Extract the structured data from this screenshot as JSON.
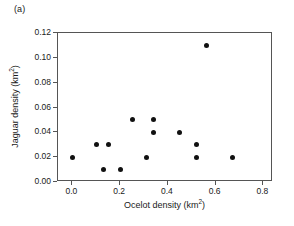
{
  "panel": {
    "label": "(a)"
  },
  "chart_data": {
    "type": "scatter",
    "title": "",
    "subtitle": "",
    "xlabel": "Ocelot density (km²)",
    "ylabel": "Jaguar density (km²)",
    "xlim": [
      -0.06,
      0.84
    ],
    "ylim": [
      0.0,
      0.12
    ],
    "xticks": [
      0.0,
      0.2,
      0.4,
      0.6,
      0.8
    ],
    "xtick_labels": [
      "0.0",
      "0.2",
      "0.4",
      "0.6",
      "0.8"
    ],
    "yticks": [
      0.0,
      0.02,
      0.04,
      0.06,
      0.08,
      0.1,
      0.12
    ],
    "ytick_labels": [
      "0.00",
      "0.02",
      "0.04",
      "0.06",
      "0.08",
      "0.10",
      "0.12"
    ],
    "grid": false,
    "legend": null,
    "marker": {
      "shape": "circle",
      "color": "#111111",
      "size_px": 5
    },
    "series": [
      {
        "name": "sites",
        "points": [
          {
            "x": 0.0,
            "y": 0.02
          },
          {
            "x": 0.1,
            "y": 0.03
          },
          {
            "x": 0.13,
            "y": 0.01
          },
          {
            "x": 0.15,
            "y": 0.03
          },
          {
            "x": 0.2,
            "y": 0.01
          },
          {
            "x": 0.25,
            "y": 0.05
          },
          {
            "x": 0.31,
            "y": 0.02
          },
          {
            "x": 0.34,
            "y": 0.05
          },
          {
            "x": 0.34,
            "y": 0.04
          },
          {
            "x": 0.45,
            "y": 0.04
          },
          {
            "x": 0.52,
            "y": 0.03
          },
          {
            "x": 0.52,
            "y": 0.02
          },
          {
            "x": 0.56,
            "y": 0.11
          },
          {
            "x": 0.67,
            "y": 0.02
          }
        ]
      }
    ]
  },
  "colors": {
    "axis": "#555555",
    "marker": "#111111",
    "text": "#1a1a1a",
    "background": "#ffffff"
  }
}
